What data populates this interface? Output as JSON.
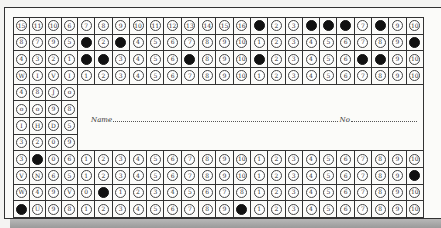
{
  "header_fragment": "",
  "card": {
    "name_label": "Name",
    "no_label": "No",
    "name_value": "",
    "no_value": ""
  },
  "colors": {
    "paper": "#fbfbf9",
    "ink": "#333333",
    "punch": "#111111",
    "shadow": "#a8a8a8"
  },
  "grid": {
    "left_columns": 4,
    "right_columns": 20,
    "rows": 12,
    "name_panel_rows": [
      5,
      6,
      7,
      8
    ],
    "punched": [
      {
        "row": 1,
        "col": 15
      },
      {
        "row": 1,
        "col": 19
      },
      {
        "row": 1,
        "col": 22
      },
      {
        "row": 1,
        "col": 20
      },
      {
        "row": 1,
        "col": 18
      },
      {
        "row": 2,
        "col": 5
      },
      {
        "row": 2,
        "col": 7
      },
      {
        "row": 2,
        "col": 24
      },
      {
        "row": 3,
        "col": 5
      },
      {
        "row": 3,
        "col": 6
      },
      {
        "row": 3,
        "col": 15
      },
      {
        "row": 3,
        "col": 21
      },
      {
        "row": 3,
        "col": 22
      },
      {
        "row": 3,
        "col": 11
      },
      {
        "row": 9,
        "col": 2
      },
      {
        "row": 10,
        "col": 24
      },
      {
        "row": 11,
        "col": 6
      },
      {
        "row": 12,
        "col": 1
      },
      {
        "row": 12,
        "col": 14
      }
    ],
    "labels": [
      [
        "15",
        "11",
        "10",
        "6",
        "7",
        "8",
        "9",
        "10",
        "11",
        "12",
        "13",
        "14",
        "15",
        "16",
        "1",
        "2",
        "3",
        "4",
        "5",
        "6",
        "7",
        "8",
        "9",
        "10"
      ],
      [
        "8",
        "7",
        "9",
        "5",
        "1",
        "2",
        "3",
        "4",
        "5",
        "6",
        "7",
        "8",
        "9",
        "10",
        "1",
        "2",
        "3",
        "4",
        "5",
        "6",
        "7",
        "8",
        "9",
        "10"
      ],
      [
        "4",
        "3",
        "2",
        "1",
        "1",
        "2",
        "3",
        "4",
        "5",
        "6",
        "7",
        "8",
        "9",
        "10",
        "1",
        "2",
        "3",
        "4",
        "5",
        "6",
        "7",
        "8",
        "9",
        "10"
      ],
      [
        "W",
        "I",
        "V",
        "I",
        "1",
        "2",
        "3",
        "4",
        "5",
        "6",
        "7",
        "8",
        "9",
        "10",
        "1",
        "2",
        "3",
        "4",
        "5",
        "6",
        "7",
        "8",
        "9",
        "10"
      ],
      [
        "4",
        "8",
        "J",
        "o"
      ],
      [
        "o",
        "o",
        "9",
        "8"
      ],
      [
        "I",
        "H",
        "D",
        "5"
      ],
      [
        "3",
        "2",
        "0",
        "9"
      ],
      [
        "3",
        "",
        "0",
        "6",
        "1",
        "2",
        "3",
        "4",
        "5",
        "6",
        "7",
        "8",
        "9",
        "10",
        "1",
        "2",
        "3",
        "4",
        "5",
        "6",
        "7",
        "8",
        "9",
        "10"
      ],
      [
        "V",
        "N",
        "6",
        "5",
        "1",
        "2",
        "3",
        "4",
        "5",
        "6",
        "7",
        "8",
        "9",
        "10",
        "1",
        "2",
        "3",
        "4",
        "5",
        "6",
        "7",
        "8",
        "9",
        ""
      ],
      [
        "W",
        "4",
        "9",
        "V",
        "0",
        "",
        "1",
        "2",
        "3",
        "4",
        "5",
        "6",
        "7",
        "8",
        "1",
        "2",
        "3",
        "4",
        "5",
        "6",
        "7",
        "8",
        "9",
        "10"
      ],
      [
        "",
        "U",
        "9",
        "8",
        "1",
        "2",
        "3",
        "4",
        "5",
        "6",
        "7",
        "8",
        "9",
        "",
        "1",
        "2",
        "3",
        "4",
        "5",
        "6",
        "7",
        "8",
        "9",
        "10"
      ]
    ]
  }
}
